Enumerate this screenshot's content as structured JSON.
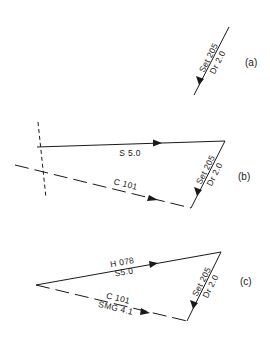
{
  "diagram": {
    "type": "vector-triangle-current-sailing",
    "parts": [
      {
        "id": "a",
        "label": "(a)",
        "vectors": [
          {
            "name": "current",
            "top_label": "Set 205",
            "bottom_label": "Dr 2.0",
            "from": [
              229,
              27
            ],
            "to": [
              194,
              95
            ]
          }
        ]
      },
      {
        "id": "b",
        "label": "(b)",
        "vectors": [
          {
            "name": "speed",
            "top_label": "",
            "bottom_label": "S 5.0",
            "from": [
              37,
              147
            ],
            "to": [
              225,
              141
            ]
          },
          {
            "name": "current",
            "top_label": "Set 205",
            "bottom_label": "Dr 2.0",
            "from": [
              225,
              141
            ],
            "to": [
              191,
              208
            ]
          },
          {
            "name": "course",
            "top_label": "C 101",
            "bottom_label": "",
            "from": [
              15,
              165
            ],
            "to": [
              191,
              208
            ],
            "style": "dashed"
          }
        ],
        "reference_line": {
          "style": "dashed",
          "from": [
            38,
            122
          ],
          "to": [
            46,
            198
          ]
        }
      },
      {
        "id": "c",
        "label": "(c)",
        "vectors": [
          {
            "name": "heading-speed",
            "top_label": "H 078",
            "bottom_label": "S5.0",
            "from": [
              36,
              285
            ],
            "to": [
              221,
              252
            ]
          },
          {
            "name": "current",
            "top_label": "Set 205",
            "bottom_label": "Dr 2.0",
            "from": [
              221,
              252
            ],
            "to": [
              187,
              321
            ]
          },
          {
            "name": "course-smg",
            "top_label": "C 101",
            "bottom_label": "SMG 4.1",
            "from": [
              36,
              285
            ],
            "to": [
              187,
              321
            ],
            "style": "dashed"
          }
        ]
      }
    ]
  },
  "labels": {
    "a_part": "(a)",
    "b_part": "(b)",
    "c_part": "(c)",
    "set": "Set 205",
    "drift": "Dr 2.0",
    "speed_b": "S 5.0",
    "course_b": "C 101",
    "heading_c": "H 078",
    "speed_c": "S5.0",
    "course_c": "C 101",
    "smg_c": "SMG 4.1"
  }
}
